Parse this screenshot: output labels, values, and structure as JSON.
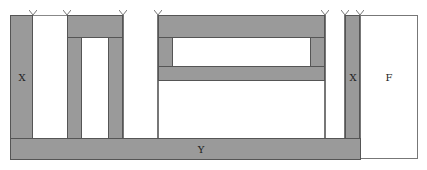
{
  "diagram": {
    "type": "layered block structure (cross-section)",
    "labels": {
      "left_column": "X",
      "right_column": "X",
      "bottom_bar": "Y",
      "right_box": "F"
    },
    "colors": {
      "fill": "#9a9a9a",
      "stroke": "#555555",
      "background": "#ffffff"
    },
    "markers": [
      {
        "x": 33
      },
      {
        "x": 67
      },
      {
        "x": 123
      },
      {
        "x": 158
      },
      {
        "x": 325
      },
      {
        "x": 345
      },
      {
        "x": 360
      }
    ]
  }
}
